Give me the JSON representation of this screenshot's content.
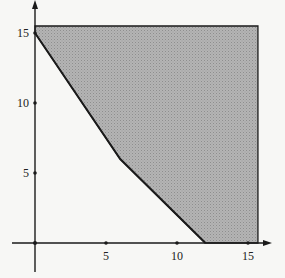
{
  "chart_data": {
    "type": "area",
    "title": "",
    "xlabel": "",
    "ylabel": "",
    "xlim": [
      -2,
      17
    ],
    "ylim": [
      -2,
      17
    ],
    "grid": false,
    "x_ticks": [
      5,
      10,
      15
    ],
    "y_ticks": [
      5,
      10,
      15
    ],
    "x_tick_labels": [
      "5",
      "10",
      "15"
    ],
    "y_tick_labels": [
      "5",
      "10",
      "15"
    ],
    "feasible_region": {
      "vertices": [
        [
          0,
          15
        ],
        [
          6,
          6
        ],
        [
          12,
          0
        ],
        [
          15.7,
          0
        ],
        [
          15.7,
          15.5
        ],
        [
          0,
          15.5
        ]
      ],
      "fill": "shaded gray",
      "boundary_line": [
        [
          0,
          15
        ],
        [
          6,
          6
        ],
        [
          12,
          0
        ]
      ]
    },
    "series": [
      {
        "name": "boundary",
        "x": [
          0,
          6,
          12
        ],
        "y": [
          15,
          6,
          0
        ]
      }
    ]
  },
  "colors": {
    "fill": "#a9a9a9",
    "line": "#1a1a1a",
    "background": "#f7f7f5"
  }
}
